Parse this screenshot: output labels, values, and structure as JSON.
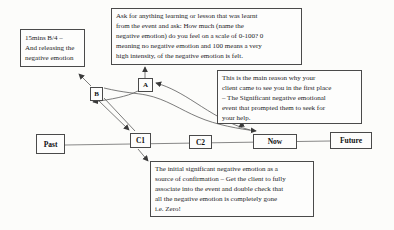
{
  "diagram_title": "Timeline therapy releasing negative emotion diagram",
  "notes": {
    "top": "Ask for anything learning or lesson that was learnt\nfrom the event and ask: How much (name the\nnegative emotion) do you feel on a scale of 0-100? 0\nmeaning no negative emotion and 100 means a very\nhigh intensity, of the negative emotion is felt.",
    "left": "15mins B/4 –\nAnd releasing the\nnegative emotion",
    "right": "This is the main reason why your\nclient came to see you in the first place\n– The Significant negative emotional\nevent that prompted them to seek for\nyour help.",
    "bottom": "The initial significant negative emotion as a\nsource of confirmation – Get the client to fully\nassociate into the event and double check that\nall the negative emotion is completely gone\ni.e. Zero!"
  },
  "points": {
    "a": "A",
    "b": "B"
  },
  "timeline": {
    "past": "Past",
    "c1": "C1",
    "c2": "C2",
    "now": "Now",
    "future": "Future"
  },
  "colors": {
    "line": "#5a5a5a",
    "arrow": "#3a3a3a",
    "border": "#4a4a4a",
    "text": "#1c1c1c",
    "background": "#fcfcfa"
  }
}
